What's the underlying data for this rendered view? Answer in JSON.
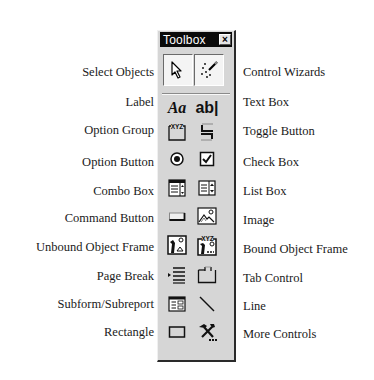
{
  "toolbox": {
    "title": "Toolbox",
    "close_glyph": "×"
  },
  "tools": {
    "select_objects": {
      "label": "Select Objects",
      "icon": "pointer-arrow-icon",
      "pressed": true
    },
    "control_wizards": {
      "label": "Control Wizards",
      "icon": "magic-wand-icon",
      "pressed": true
    },
    "label": {
      "label": "Label",
      "icon": "aa-label-icon",
      "glyph": "Aa"
    },
    "text_box": {
      "label": "Text Box",
      "icon": "ab-textbox-icon",
      "glyph": "ab|"
    },
    "option_group": {
      "label": "Option Group",
      "icon": "option-group-icon",
      "glyph": "XYZ"
    },
    "toggle_button": {
      "label": "Toggle Button",
      "icon": "toggle-button-icon"
    },
    "option_button": {
      "label": "Option Button",
      "icon": "radio-button-icon"
    },
    "check_box": {
      "label": "Check Box",
      "icon": "checkbox-icon"
    },
    "combo_box": {
      "label": "Combo Box",
      "icon": "combo-box-icon"
    },
    "list_box": {
      "label": "List Box",
      "icon": "list-box-icon"
    },
    "command_button": {
      "label": "Command Button",
      "icon": "command-button-icon"
    },
    "image": {
      "label": "Image",
      "icon": "image-icon"
    },
    "unbound_object_frame": {
      "label": "Unbound Object Frame",
      "icon": "unbound-object-frame-icon"
    },
    "bound_object_frame": {
      "label": "Bound Object Frame",
      "icon": "bound-object-frame-icon",
      "glyph": "XYZ"
    },
    "page_break": {
      "label": "Page Break",
      "icon": "page-break-icon"
    },
    "tab_control": {
      "label": "Tab Control",
      "icon": "tab-control-icon"
    },
    "subform_subreport": {
      "label": "Subform/Subreport",
      "icon": "subform-icon"
    },
    "line": {
      "label": "Line",
      "icon": "line-icon"
    },
    "rectangle": {
      "label": "Rectangle",
      "icon": "rectangle-icon"
    },
    "more_controls": {
      "label": "More Controls",
      "icon": "more-controls-hammer-icon"
    }
  }
}
